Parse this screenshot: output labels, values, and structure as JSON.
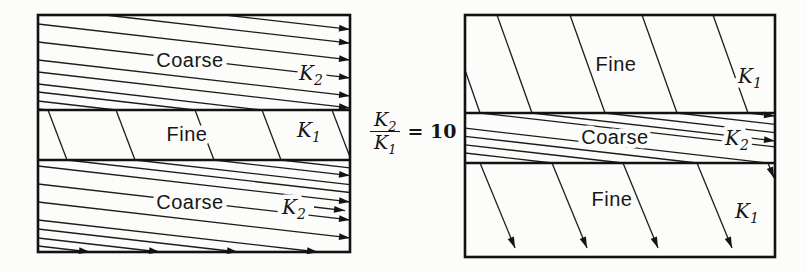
{
  "figure": {
    "background": "#fcfcfb",
    "ink": "#161616",
    "equation": {
      "num": "K",
      "num_sub": "2",
      "den": "K",
      "den_sub": "1",
      "rhs": "= 10"
    },
    "diagrams": [
      {
        "name": "left-stratified-section",
        "x": 38,
        "y": 15,
        "w": 312,
        "h": 237,
        "boundaries": [
          110,
          160
        ],
        "labels": [
          {
            "name": "coarse-top-label",
            "text": "Coarse",
            "x": 190,
            "y": 60,
            "style": "mat"
          },
          {
            "name": "k2-top-label",
            "text": "K",
            "sub": "2",
            "x": 311,
            "y": 73,
            "style": "k"
          },
          {
            "name": "fine-mid-label",
            "text": "Fine",
            "x": 187,
            "y": 134,
            "style": "mat"
          },
          {
            "name": "k1-mid-label",
            "text": "K",
            "sub": "1",
            "x": 309,
            "y": 130,
            "style": "k"
          },
          {
            "name": "coarse-bottom-label",
            "text": "Coarse",
            "x": 190,
            "y": 202,
            "style": "mat"
          },
          {
            "name": "k2-bottom-label",
            "text": "K",
            "sub": "2",
            "x": 294,
            "y": 207,
            "style": "k"
          }
        ],
        "flow_lines": [
          [
            225,
            15,
            350,
            29.4,
            1
          ],
          [
            105,
            15,
            350,
            43.2,
            1
          ],
          [
            38,
            24,
            350,
            59.9,
            1
          ],
          [
            38,
            42,
            350,
            77.9,
            1
          ],
          [
            38,
            60,
            350,
            95.9,
            1
          ],
          [
            38,
            72,
            350,
            107.9,
            1
          ],
          [
            38,
            84,
            262,
            110,
            0
          ],
          [
            38,
            92,
            195,
            110,
            0
          ],
          [
            38,
            101,
            116,
            110,
            0
          ],
          [
            38,
            108.8,
            48,
            110,
            0
          ],
          [
            48,
            110,
            67,
            160,
            0
          ],
          [
            116,
            110,
            135,
            160,
            0
          ],
          [
            195,
            110,
            214,
            160,
            0
          ],
          [
            262,
            110,
            281,
            160,
            0
          ],
          [
            332,
            110,
            350,
            157,
            0
          ],
          [
            67,
            160,
            350,
            192.5,
            0
          ],
          [
            135,
            160,
            350,
            184.7,
            0
          ],
          [
            214,
            160,
            350,
            175.6,
            1
          ],
          [
            281,
            160,
            350,
            167.9,
            0
          ],
          [
            38,
            166,
            350,
            201.9,
            1
          ],
          [
            38,
            184,
            350,
            219.9,
            1
          ],
          [
            38,
            202,
            350,
            237.9,
            1
          ],
          [
            38,
            220,
            318,
            252,
            1
          ],
          [
            38,
            229,
            238,
            252,
            1
          ],
          [
            38,
            238,
            160,
            252,
            1
          ],
          [
            38,
            246,
            90,
            252,
            1
          ],
          [
            314,
            207,
            345,
            210.6,
            1
          ]
        ]
      },
      {
        "name": "right-stratified-section",
        "x": 465,
        "y": 15,
        "w": 310,
        "h": 242,
        "boundaries": [
          113,
          163
        ],
        "labels": [
          {
            "name": "fine-top-label",
            "text": "Fine",
            "x": 616,
            "y": 64,
            "style": "mat"
          },
          {
            "name": "k1-top-label",
            "text": "K",
            "sub": "1",
            "x": 750,
            "y": 76,
            "style": "k"
          },
          {
            "name": "coarse-mid-label",
            "text": "Coarse",
            "x": 615,
            "y": 137,
            "style": "mat"
          },
          {
            "name": "k2-mid-label",
            "text": "K",
            "sub": "2",
            "x": 737,
            "y": 138,
            "style": "k"
          },
          {
            "name": "fine-bottom-label",
            "text": "Fine",
            "x": 612,
            "y": 199,
            "style": "mat"
          },
          {
            "name": "k1-bottom-label",
            "text": "K",
            "sub": "1",
            "x": 747,
            "y": 211,
            "style": "k"
          }
        ],
        "flow_lines": [
          [
            465,
            70,
            480,
            113,
            0
          ],
          [
            497,
            15,
            532,
            113,
            0
          ],
          [
            570,
            15,
            605,
            113,
            0
          ],
          [
            642,
            15,
            677,
            113,
            0
          ],
          [
            713,
            15,
            748,
            113,
            0
          ],
          [
            480,
            113,
            775,
            146.9,
            0
          ],
          [
            532,
            113,
            775,
            140.9,
            1
          ],
          [
            605,
            113,
            775,
            132.6,
            0
          ],
          [
            677,
            113,
            775,
            124.3,
            0
          ],
          [
            748,
            113,
            775,
            116.1,
            1
          ],
          [
            465,
            128.2,
            768,
            163,
            0
          ],
          [
            465,
            136.3,
            697,
            163,
            0
          ],
          [
            465,
            144.8,
            623,
            163,
            0
          ],
          [
            465,
            153,
            552,
            163,
            0
          ],
          [
            480,
            163,
            515,
            248,
            1
          ],
          [
            552,
            163,
            587,
            248,
            1
          ],
          [
            623,
            163,
            658,
            248,
            1
          ],
          [
            697,
            163,
            732,
            248,
            1
          ],
          [
            768,
            163,
            774,
            178,
            1
          ]
        ]
      }
    ]
  }
}
